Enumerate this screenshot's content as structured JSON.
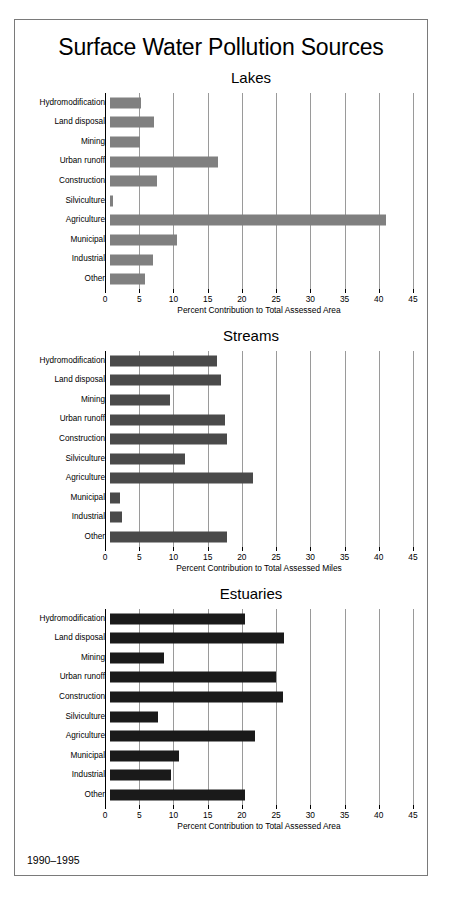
{
  "figure": {
    "title": "Surface Water Pollution Sources",
    "footer": "1990–1995"
  },
  "chart_data": [
    {
      "type": "bar",
      "orientation": "horizontal",
      "title": "Lakes",
      "xlabel": "Percent Contribution to Total Assessed Area",
      "ylabel": "",
      "xlim": [
        0,
        45
      ],
      "xticks": [
        0,
        5,
        10,
        15,
        20,
        25,
        30,
        35,
        40,
        45
      ],
      "xtick_labels": [
        "0",
        "5",
        "10",
        "15",
        "20",
        "25",
        "30",
        "35",
        "40",
        "45"
      ],
      "grid": true,
      "legend": "none",
      "bar_color": "#808080",
      "categories": [
        "Hydromodification",
        "Land disposal",
        "Mining",
        "Urban runoff",
        "Construction",
        "Silviculture",
        "Agriculture",
        "Municipal",
        "Industrial",
        "Other"
      ],
      "values": [
        4.6,
        6.6,
        4.4,
        16.0,
        7.0,
        0.5,
        41.0,
        10.0,
        6.4,
        5.2
      ]
    },
    {
      "type": "bar",
      "orientation": "horizontal",
      "title": "Streams",
      "xlabel": "Percent Contribution to Total Assessed Miles",
      "ylabel": "",
      "xlim": [
        0,
        45
      ],
      "xticks": [
        0,
        5,
        10,
        15,
        20,
        25,
        30,
        35,
        40,
        45
      ],
      "xtick_labels": [
        "0",
        "5",
        "10",
        "15",
        "20",
        "25",
        "30",
        "35",
        "40",
        "45"
      ],
      "grid": true,
      "legend": "none",
      "bar_color": "#4a4a4a",
      "categories": [
        "Hydromodification",
        "Land disposal",
        "Mining",
        "Urban runoff",
        "Construction",
        "Silviculture",
        "Agriculture",
        "Municipal",
        "Industrial",
        "Other"
      ],
      "values": [
        15.9,
        16.5,
        8.9,
        17.1,
        17.4,
        11.2,
        21.3,
        1.5,
        1.8,
        17.4
      ]
    },
    {
      "type": "bar",
      "orientation": "horizontal",
      "title": "Estuaries",
      "xlabel": "Percent Contribution to Total Assessed Area",
      "ylabel": "",
      "xlim": [
        0,
        45
      ],
      "xticks": [
        0,
        5,
        10,
        15,
        20,
        25,
        30,
        35,
        40,
        45
      ],
      "xtick_labels": [
        "0",
        "5",
        "10",
        "15",
        "20",
        "25",
        "30",
        "35",
        "40",
        "45"
      ],
      "grid": true,
      "legend": "none",
      "bar_color": "#1a1a1a",
      "categories": [
        "Hydromodification",
        "Land disposal",
        "Mining",
        "Urban runoff",
        "Construction",
        "Silviculture",
        "Agriculture",
        "Municipal",
        "Industrial",
        "Other"
      ],
      "values": [
        20.0,
        25.8,
        8.0,
        24.6,
        25.7,
        7.2,
        21.5,
        10.2,
        9.0,
        20.0
      ]
    }
  ]
}
